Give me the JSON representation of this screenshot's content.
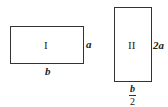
{
  "figure": {
    "rect1": {
      "label": "I",
      "side_label": "a",
      "bottom_label": "b"
    },
    "rect2": {
      "label": "II",
      "side_label": "2a",
      "bottom_numerator": "b",
      "bottom_denominator": "2"
    }
  }
}
